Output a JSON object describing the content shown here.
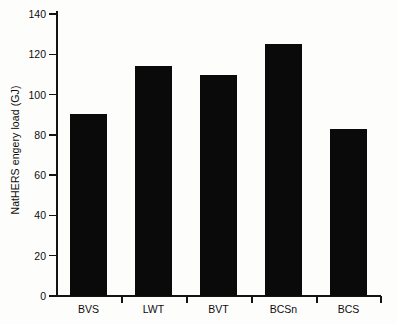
{
  "chart_data": {
    "type": "bar",
    "title": "",
    "xlabel": "",
    "ylabel": "NatHERS engery load (GJ)",
    "categories": [
      "BVS",
      "LWT",
      "BVT",
      "BCSn",
      "BCS"
    ],
    "values": [
      90.5,
      114,
      109.5,
      125,
      83
    ],
    "series": [
      {
        "name": "NatHERS energy load",
        "values": [
          90.5,
          114,
          109.5,
          125,
          83
        ]
      }
    ],
    "ylim": [
      0,
      140
    ],
    "yticks": [
      0,
      20,
      40,
      60,
      80,
      100,
      120,
      140
    ],
    "ytick_labels": [
      "0",
      "20",
      "40",
      "60",
      "80",
      "100",
      "120",
      "140"
    ],
    "grid": false,
    "legend": null,
    "bar_color": "#0a0a0a",
    "axis_color": "#131313",
    "background_color": "#fdfdfc"
  }
}
